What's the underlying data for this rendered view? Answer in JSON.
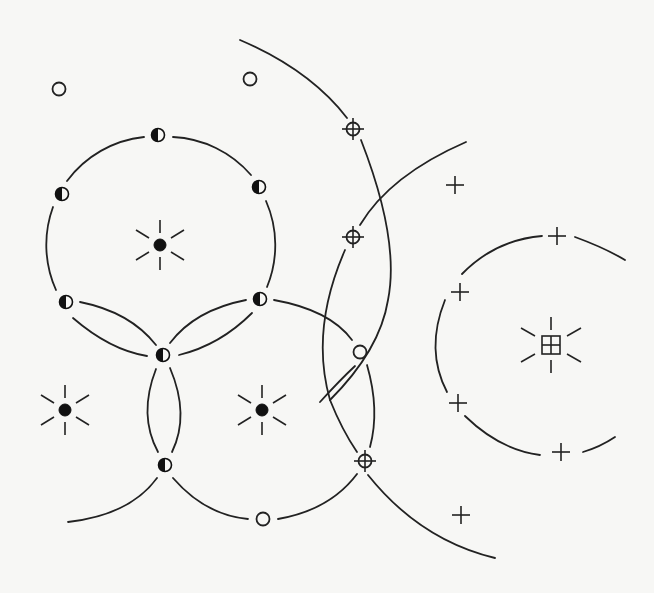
{
  "figure": {
    "colors": {
      "ink": "#222222",
      "paper": "#f7f7f5"
    },
    "stars": [
      {
        "id": "star-a",
        "x": 160,
        "y": 245,
        "type": "filled-dot"
      },
      {
        "id": "star-b",
        "x": 65,
        "y": 410,
        "type": "filled-dot"
      },
      {
        "id": "star-c",
        "x": 262,
        "y": 410,
        "type": "filled-dot"
      },
      {
        "id": "star-d",
        "x": 550,
        "y": 345,
        "type": "boxed-cross"
      }
    ],
    "half_filled_points": [
      {
        "x": 158,
        "y": 135
      },
      {
        "x": 62,
        "y": 194
      },
      {
        "x": 259,
        "y": 187
      },
      {
        "x": 66,
        "y": 302
      },
      {
        "x": 260,
        "y": 299
      },
      {
        "x": 163,
        "y": 355
      },
      {
        "x": 165,
        "y": 465
      }
    ],
    "open_points": [
      {
        "x": 59,
        "y": 89
      },
      {
        "x": 250,
        "y": 79
      },
      {
        "x": 360,
        "y": 352
      },
      {
        "x": 263,
        "y": 519
      }
    ],
    "crosshair_points": [
      {
        "x": 353,
        "y": 129
      },
      {
        "x": 353,
        "y": 237
      },
      {
        "x": 365,
        "y": 461
      }
    ],
    "plus_points": [
      {
        "x": 455,
        "y": 185
      },
      {
        "x": 557,
        "y": 236
      },
      {
        "x": 460,
        "y": 292
      },
      {
        "x": 458,
        "y": 403
      },
      {
        "x": 561,
        "y": 452
      },
      {
        "x": 461,
        "y": 515
      }
    ]
  }
}
